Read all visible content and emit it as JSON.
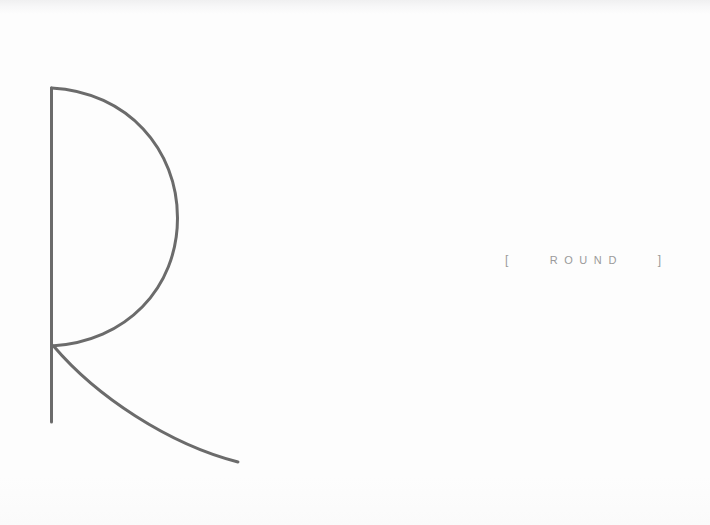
{
  "canvas": {
    "width": 710,
    "height": 525,
    "background_color": "#fdfdfd",
    "top_edge_shade_color": "#f0f0f1"
  },
  "logo": {
    "mark_name": "letter-r-monogram",
    "stroke_color": "#6b6b6b",
    "stroke_width": 3,
    "stem": {
      "x": 51,
      "y_top": 88,
      "y_bottom": 422
    },
    "bowl": {
      "start_x": 51,
      "start_y": 88,
      "extreme_right_x": 177,
      "extreme_right_y": 218,
      "end_x": 51,
      "end_y": 346
    },
    "leg": {
      "start_x": 54,
      "start_y": 346,
      "end_x": 238,
      "end_y": 462
    }
  },
  "wordmark": {
    "bracket_open": "[",
    "bracket_close": "]",
    "text": "ROUND",
    "color": "#9a9a9a",
    "letter_spacing_px": 6.6,
    "font_size_px": 11,
    "center_x": 583,
    "center_y": 260
  }
}
